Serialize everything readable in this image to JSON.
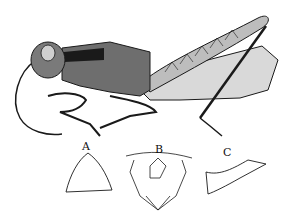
{
  "figure": {
    "labels": {
      "a": "A",
      "b": "B",
      "c": "C"
    },
    "colors": {
      "ink": "#1a1a1a",
      "paper": "#ffffff",
      "shade": "#8a8a8a"
    }
  }
}
